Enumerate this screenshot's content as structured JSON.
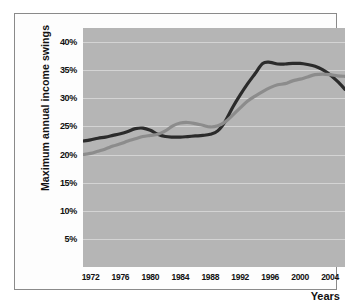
{
  "chart_data": {
    "type": "line",
    "title": "",
    "xlabel": "Years",
    "ylabel": "Maximum annual income swings",
    "xlim": [
      1971,
      2006
    ],
    "ylim": [
      0,
      42.5
    ],
    "grid": true,
    "legend": "none",
    "plot_background": "#b5b5b5",
    "gridline_color": "#d4d4d4",
    "x_tick_labels": [
      "1972",
      "1976",
      "1980",
      "1984",
      "1988",
      "1992",
      "1996",
      "2000",
      "2004"
    ],
    "x_tick_values": [
      1972,
      1976,
      1980,
      1984,
      1988,
      1992,
      1996,
      2000,
      2004
    ],
    "y_tick_labels": [
      "5%",
      "10%",
      "15%",
      "20%",
      "25%",
      "30%",
      "35%",
      "40%"
    ],
    "y_tick_values": [
      5,
      10,
      15,
      20,
      25,
      30,
      35,
      40
    ],
    "x": [
      1971,
      1972,
      1973,
      1974,
      1975,
      1976,
      1977,
      1978,
      1979,
      1980,
      1981,
      1982,
      1983,
      1984,
      1985,
      1986,
      1987,
      1988,
      1989,
      1990,
      1991,
      1992,
      1993,
      1994,
      1995,
      1996,
      1997,
      1998,
      1999,
      2000,
      2001,
      2002,
      2003,
      2004,
      2005,
      2006
    ],
    "series": [
      {
        "name": "dark-series",
        "color": "#2b2b2b",
        "line_width": 3.2,
        "values": [
          22.4,
          22.6,
          22.9,
          23.1,
          23.4,
          23.7,
          24.1,
          24.6,
          24.7,
          24.3,
          23.6,
          23.2,
          23.1,
          23.1,
          23.2,
          23.3,
          23.4,
          23.6,
          24.2,
          25.9,
          28.4,
          30.6,
          32.6,
          34.4,
          36.2,
          36.4,
          36.1,
          36.1,
          36.2,
          36.2,
          36.0,
          35.7,
          35.1,
          34.2,
          33.0,
          31.6
        ]
      },
      {
        "name": "light-series",
        "color": "#8c8c8c",
        "line_width": 3.2,
        "values": [
          20.0,
          20.2,
          20.6,
          21.0,
          21.5,
          21.9,
          22.4,
          22.8,
          23.2,
          23.4,
          23.6,
          24.2,
          25.1,
          25.6,
          25.7,
          25.5,
          25.2,
          24.9,
          25.1,
          25.8,
          27.0,
          28.3,
          29.5,
          30.4,
          31.2,
          31.9,
          32.4,
          32.6,
          33.1,
          33.4,
          33.8,
          34.2,
          34.3,
          34.2,
          34.0,
          33.9
        ]
      }
    ]
  }
}
